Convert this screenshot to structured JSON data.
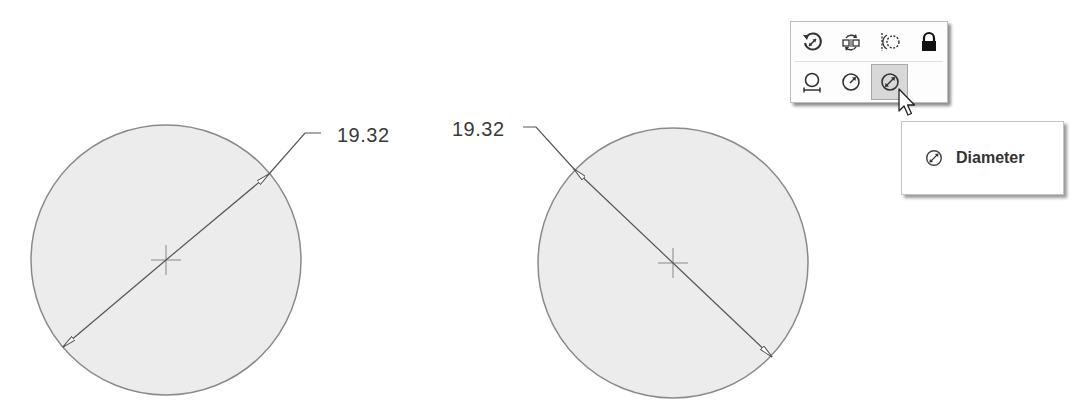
{
  "drawing": {
    "circles": [
      {
        "id": "left",
        "cx": 166,
        "cy": 260,
        "r": 135,
        "dimension_type": "diameter",
        "dimension_value": "19.32"
      },
      {
        "id": "right",
        "cx": 673,
        "cy": 263,
        "r": 135,
        "dimension_type": "diameter",
        "dimension_value": "19.32"
      }
    ],
    "colors": {
      "circle_fill": "#ececec",
      "circle_stroke": "#8a8a8a",
      "dimension_line": "#555555",
      "text": "#3a3a3a"
    }
  },
  "dimension_labels": {
    "left": "19.32",
    "right": "19.32"
  },
  "dimension_toolbar": {
    "row1": [
      {
        "icon": "rotate-dimension-icon",
        "label": "Flip/Rotate dimension"
      },
      {
        "icon": "swap-sides-icon",
        "label": "Swap sides"
      },
      {
        "icon": "concentric-arc-icon",
        "label": "Arc extension"
      },
      {
        "icon": "lock-icon",
        "label": "Lock"
      }
    ],
    "row2": [
      {
        "icon": "linear-circle-icon",
        "label": "Linear"
      },
      {
        "icon": "radius-icon",
        "label": "Radius"
      },
      {
        "icon": "diameter-icon",
        "label": "Diameter",
        "selected": true
      }
    ]
  },
  "tooltip": {
    "icon": "diameter-icon",
    "label": "Diameter"
  }
}
